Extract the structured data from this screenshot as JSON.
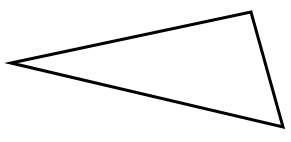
{
  "figure": {
    "kind": "triangle-outline",
    "width": 291,
    "height": 142,
    "background_color": "#FFFFFF",
    "stroke_color": "#000000",
    "fill_color": "none",
    "stroke_width": 3,
    "line_join": "miter",
    "vertices": [
      {
        "name": "left-apex",
        "x": 11,
        "y": 63
      },
      {
        "name": "top-right-vertex",
        "x": 251,
        "y": 12
      },
      {
        "name": "bottom-right-vertex",
        "x": 283,
        "y": 127
      }
    ],
    "edges": [
      {
        "name": "top-edge",
        "from": "left-apex",
        "to": "top-right-vertex"
      },
      {
        "name": "right-edge",
        "from": "top-right-vertex",
        "to": "bottom-right-vertex"
      },
      {
        "name": "bottom-edge",
        "from": "bottom-right-vertex",
        "to": "left-apex"
      }
    ]
  }
}
